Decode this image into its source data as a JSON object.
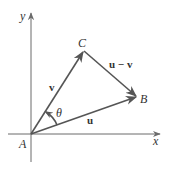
{
  "diagram": {
    "axes": {
      "x_label": "x",
      "y_label": "y"
    },
    "points": {
      "A": {
        "label": "A"
      },
      "B": {
        "label": "B"
      },
      "C": {
        "label": "C"
      }
    },
    "vectors": {
      "u": {
        "label": "u",
        "from": "A",
        "to": "B"
      },
      "v": {
        "label": "v",
        "from": "A",
        "to": "C"
      },
      "u_minus_v": {
        "label": "u − v",
        "from": "C",
        "to": "B"
      }
    },
    "angle": {
      "label": "θ",
      "between": [
        "u",
        "v"
      ]
    },
    "colors": {
      "line": "#555555",
      "axis": "#6b6b6b",
      "text": "#333333",
      "background": "#ffffff"
    }
  }
}
